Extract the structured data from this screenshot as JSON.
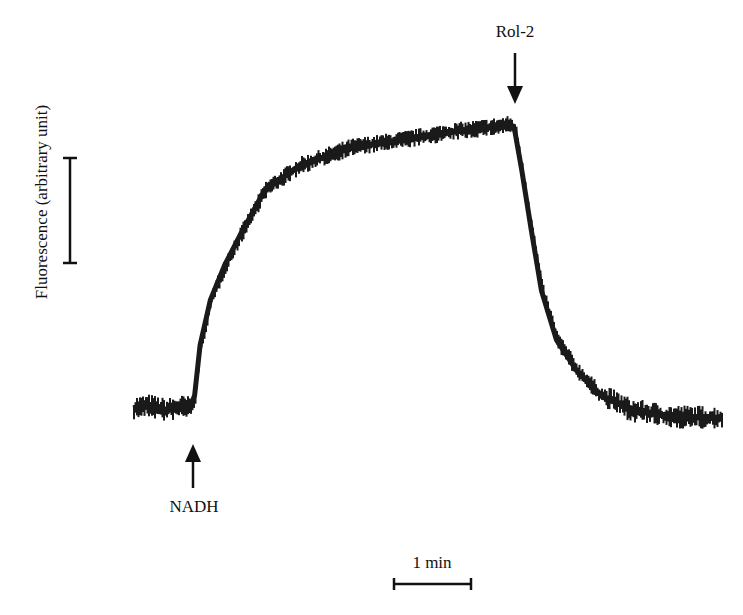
{
  "chart_data": {
    "type": "line",
    "title": "",
    "xlabel": "Time",
    "ylabel": "Fluorescence (arbitrary unit)",
    "x_unit": "min",
    "y_unit": "arbitrary unit",
    "grid": false,
    "legend": null,
    "axes_drawn": false,
    "scale_bars": {
      "x": {
        "label": "1 min",
        "length": 1
      },
      "y": {
        "label": "",
        "length": 1,
        "note": "vertical bar = 1 arbitrary fluorescence unit"
      }
    },
    "annotations": [
      {
        "label": "NADH",
        "x": 0.76,
        "arrow": "up",
        "position": "below trace"
      },
      {
        "label": "Rol-2",
        "x": 4.83,
        "arrow": "down",
        "position": "above trace"
      }
    ],
    "xlim": [
      0,
      7.5
    ],
    "ylim": [
      -0.3,
      3.0
    ],
    "series": [
      {
        "name": "Fluorescence trace",
        "color": "#1a1a1a",
        "x": [
          0.0,
          0.2,
          0.4,
          0.6,
          0.72,
          0.78,
          0.85,
          0.98,
          1.16,
          1.35,
          1.67,
          2.11,
          2.74,
          3.38,
          4.01,
          4.47,
          4.76,
          4.83,
          4.92,
          5.04,
          5.17,
          5.36,
          5.61,
          5.92,
          6.3,
          6.77,
          7.2,
          7.46
        ],
        "y": [
          0.0,
          0.02,
          -0.02,
          0.01,
          0.0,
          0.12,
          0.6,
          1.03,
          1.36,
          1.64,
          2.08,
          2.31,
          2.48,
          2.55,
          2.63,
          2.67,
          2.7,
          2.65,
          2.27,
          1.7,
          1.12,
          0.65,
          0.36,
          0.12,
          -0.02,
          -0.08,
          -0.09,
          -0.1
        ]
      }
    ]
  },
  "labels": {
    "ylabel": "Fluorescence (arbitrary unit)",
    "nadh": "NADH",
    "rol2": "Rol-2",
    "time_scale": "1 min"
  },
  "colors": {
    "trace": "#1a1a1a",
    "background": "#ffffff",
    "ink": "#111111"
  }
}
